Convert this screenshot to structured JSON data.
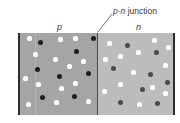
{
  "diagram": {
    "type": "p-n junction",
    "labels": {
      "p": "p",
      "n": "n",
      "junction_prefix": "p-n",
      "junction_suffix": " junction"
    },
    "colors": {
      "p_region": "#a5a5a5",
      "n_region": "#bcbcbc",
      "border": "#2e2e2e",
      "junction_line": "#4a4a4a",
      "white_dot": "#ffffff",
      "p_dark_dot": "#1e1e1e",
      "n_dark_dot": "#4a4a4a"
    },
    "p_region": {
      "white_dots": [
        [
          29,
          38
        ],
        [
          60,
          39
        ],
        [
          75,
          38
        ],
        [
          35,
          54
        ],
        [
          55,
          59
        ],
        [
          69,
          66
        ],
        [
          83,
          61
        ],
        [
          25,
          78
        ],
        [
          38,
          84
        ],
        [
          61,
          88
        ],
        [
          75,
          83
        ],
        [
          28,
          104
        ],
        [
          56,
          102
        ],
        [
          88,
          101
        ]
      ],
      "dark_dots": [
        [
          40,
          42
        ],
        [
          93,
          38
        ],
        [
          76,
          51
        ],
        [
          37,
          69
        ],
        [
          59,
          76
        ],
        [
          88,
          73
        ],
        [
          42,
          97
        ],
        [
          74,
          96
        ]
      ]
    },
    "n_region": {
      "white_dots": [
        [
          109,
          43
        ],
        [
          138,
          52
        ],
        [
          154,
          40
        ],
        [
          168,
          47
        ],
        [
          105,
          59
        ],
        [
          120,
          56
        ],
        [
          165,
          65
        ],
        [
          133,
          72
        ],
        [
          120,
          84
        ],
        [
          152,
          87
        ],
        [
          104,
          91
        ],
        [
          165,
          93
        ],
        [
          139,
          104
        ]
      ],
      "dark_dots": [
        [
          127,
          45
        ],
        [
          156,
          52
        ],
        [
          113,
          68
        ],
        [
          150,
          74
        ],
        [
          167,
          82
        ],
        [
          142,
          89
        ],
        [
          120,
          102
        ],
        [
          157,
          103
        ]
      ]
    }
  }
}
